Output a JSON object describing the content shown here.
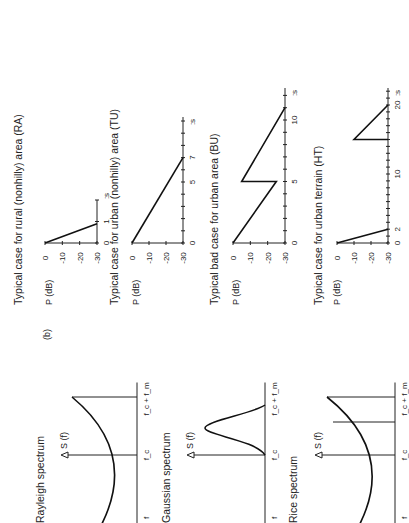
{
  "figure": {
    "orientation": "rotated 90 degrees counter-clockwise",
    "panel_label": "(b)"
  },
  "spectra": [
    {
      "title": "Rayleigh spectrum",
      "ylabel": "S (f)",
      "xlabels": [
        "f_c − f_m",
        "f_c",
        "f_c + f_m"
      ],
      "shape": "u-shaped (Jakes)"
    },
    {
      "title": "Gaussian spectrum",
      "ylabel": "S (f)",
      "xlabels": [
        "f_c − f_m",
        "f_c",
        "f_c + f_m"
      ],
      "shape": "gaussian offset"
    },
    {
      "title": "Rice spectrum",
      "ylabel": "S (f)",
      "xlabels": [
        "f_c − f_m",
        "f_c",
        "f_c + f_m"
      ],
      "shape": "u-shaped with direct line"
    }
  ],
  "chart_data": [
    {
      "type": "line",
      "title": "Typical case for rural (nonhilly) area (RA)",
      "xlabel": ":s",
      "ylabel": "P (dB)",
      "xticks": [
        0,
        1
      ],
      "yticks": [
        0,
        -10,
        -20,
        -30
      ],
      "ylim": [
        -30,
        0
      ],
      "xlim": [
        0,
        1.6
      ],
      "x": [
        0,
        0.9
      ],
      "values": [
        0,
        -30
      ]
    },
    {
      "type": "line",
      "title": "Typical case for urban (nonhilly) area (TU)",
      "xlabel": ":s",
      "ylabel": "P (dB)",
      "xticks": [
        0,
        5,
        7
      ],
      "yticks": [
        0,
        -10,
        -20,
        -30
      ],
      "ylim": [
        -30,
        0
      ],
      "xlim": [
        0,
        10.3
      ],
      "x": [
        0,
        7
      ],
      "values": [
        0,
        -30
      ]
    },
    {
      "type": "line",
      "title": "Typical bad case for urban area (BU)",
      "xlabel": ":s",
      "ylabel": "P (dB)",
      "xticks": [
        0,
        5,
        10
      ],
      "yticks": [
        0,
        -10,
        -20,
        -30
      ],
      "ylim": [
        -30,
        0
      ],
      "xlim": [
        0,
        12.6
      ],
      "x": [
        0,
        5,
        5,
        11
      ],
      "values": [
        0,
        -25,
        -5,
        -30
      ]
    },
    {
      "type": "line",
      "title": "Typical case for urban terrain (HT)",
      "xlabel": ":s",
      "ylabel": "P (dB)",
      "xticks": [
        0,
        2,
        10,
        20
      ],
      "yticks": [
        0,
        -10,
        -20,
        -30
      ],
      "ylim": [
        -30,
        0
      ],
      "xlim": [
        0,
        22.5
      ],
      "series": [
        {
          "name": "first cluster",
          "x": [
            0,
            2
          ],
          "values": [
            0,
            -30
          ]
        },
        {
          "name": "second cluster",
          "x": [
            15,
            15,
            20
          ],
          "values": [
            -30,
            -10,
            -30
          ]
        }
      ]
    }
  ]
}
